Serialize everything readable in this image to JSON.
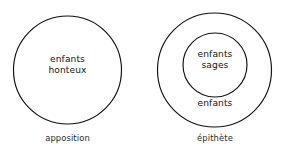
{
  "figure": {
    "background_color": "#ffffff",
    "stroke_color": "#111111",
    "text_color": "#141414"
  },
  "diagrams": [
    {
      "name": "apposition",
      "caption": "apposition",
      "circles": [
        {
          "role": "outer",
          "cx": 67.5,
          "cy": 70,
          "r": 54
        }
      ],
      "set_text": "enfants\nhonteux"
    },
    {
      "name": "epithete",
      "caption": "épithète",
      "circles": [
        {
          "role": "outer",
          "cx": 214.5,
          "cy": 70,
          "r": 57
        },
        {
          "role": "inner",
          "cx": 215,
          "cy": 65,
          "r": 32
        }
      ],
      "inner_text": "enfants\nsages",
      "outer_text": "enfants"
    }
  ]
}
